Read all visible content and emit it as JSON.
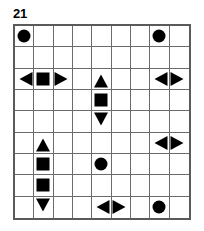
{
  "puzzle": {
    "title": "21",
    "grid": {
      "rows": 9,
      "cols": 9,
      "border_color": "#5a5a5a",
      "line_color": "#6b6b6b",
      "shape_color": "#000000",
      "background": "#ffffff"
    },
    "shapes": [
      {
        "row": 1,
        "col": 1,
        "type": "circle",
        "name": "shape-circle-r1c1"
      },
      {
        "row": 1,
        "col": 8,
        "type": "circle",
        "name": "shape-circle-r1c8"
      },
      {
        "row": 3,
        "col": 1,
        "type": "tri-left",
        "name": "shape-triangle-left-r3c1"
      },
      {
        "row": 3,
        "col": 2,
        "type": "square",
        "name": "shape-square-r3c2"
      },
      {
        "row": 3,
        "col": 3,
        "type": "tri-right",
        "name": "shape-triangle-right-r3c3"
      },
      {
        "row": 3,
        "col": 5,
        "type": "tri-up",
        "name": "shape-triangle-up-r3c5"
      },
      {
        "row": 3,
        "col": 8,
        "type": "tri-left",
        "name": "shape-triangle-left-r3c8"
      },
      {
        "row": 3,
        "col": 9,
        "type": "tri-right",
        "name": "shape-triangle-right-r3c9"
      },
      {
        "row": 4,
        "col": 5,
        "type": "square",
        "name": "shape-square-r4c5"
      },
      {
        "row": 5,
        "col": 5,
        "type": "tri-down",
        "name": "shape-triangle-down-r5c5"
      },
      {
        "row": 6,
        "col": 2,
        "type": "tri-up",
        "name": "shape-triangle-up-r6c2"
      },
      {
        "row": 6,
        "col": 8,
        "type": "tri-left",
        "name": "shape-triangle-left-r6c8"
      },
      {
        "row": 6,
        "col": 9,
        "type": "tri-right",
        "name": "shape-triangle-right-r6c9"
      },
      {
        "row": 7,
        "col": 2,
        "type": "square",
        "name": "shape-square-r7c2"
      },
      {
        "row": 7,
        "col": 5,
        "type": "circle",
        "name": "shape-circle-r7c5"
      },
      {
        "row": 8,
        "col": 2,
        "type": "square",
        "name": "shape-square-r8c2"
      },
      {
        "row": 9,
        "col": 2,
        "type": "tri-down",
        "name": "shape-triangle-down-r9c2"
      },
      {
        "row": 9,
        "col": 5,
        "type": "tri-left",
        "name": "shape-triangle-left-r9c5"
      },
      {
        "row": 9,
        "col": 6,
        "type": "tri-right",
        "name": "shape-triangle-right-r9c6"
      },
      {
        "row": 9,
        "col": 8,
        "type": "circle",
        "name": "shape-circle-r9c8"
      }
    ]
  }
}
